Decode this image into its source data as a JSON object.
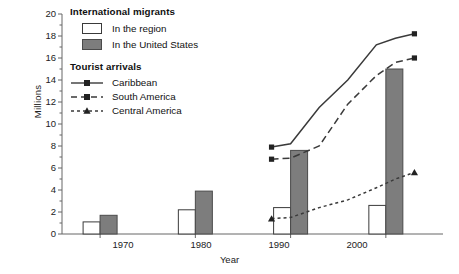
{
  "chart_data": {
    "type": "bar",
    "title": "",
    "xlabel": "Year",
    "ylabel": "Millions",
    "xlim": [
      1966,
      2006
    ],
    "ylim": [
      0,
      20
    ],
    "ytick_step": 2,
    "minor_ytick_step": 1,
    "grid": false,
    "categories": [
      "1970",
      "1980",
      "1990",
      "2000"
    ],
    "xticks": [
      1970,
      1980,
      1990,
      2000
    ],
    "yticks": [
      0,
      2,
      4,
      6,
      8,
      10,
      12,
      14,
      16,
      18,
      20
    ],
    "legend_position": "upper-left-inside",
    "bar_series": [
      {
        "name": "In the region",
        "group": "International migrants",
        "fill": "#ffffff",
        "edge": "#3a3a3a",
        "categories": [
          "1970",
          "1980",
          "1990",
          "2000"
        ],
        "values": [
          1.1,
          2.2,
          2.4,
          2.6
        ]
      },
      {
        "name": "In the United States",
        "group": "International migrants",
        "fill": "#7d7d7d",
        "edge": "#4a4a4a",
        "categories": [
          "1970",
          "1980",
          "1990",
          "2000"
        ],
        "values": [
          1.7,
          3.9,
          7.6,
          15.0
        ]
      }
    ],
    "line_series": [
      {
        "name": "Caribbean",
        "group": "Tourist arrivals",
        "style": "solid",
        "marker": "square",
        "color": "#3a3a3a",
        "x": [
          1988,
          1990,
          1993,
          1996,
          1999,
          2001,
          2003
        ],
        "values": [
          7.9,
          8.2,
          11.5,
          14.0,
          17.2,
          17.8,
          18.2
        ]
      },
      {
        "name": "South America",
        "group": "Tourist arrivals",
        "style": "dashed",
        "marker": "square",
        "color": "#3a3a3a",
        "x": [
          1988,
          1990,
          1993,
          1996,
          1999,
          2001,
          2003
        ],
        "values": [
          6.8,
          6.9,
          8.0,
          11.8,
          14.4,
          15.6,
          16.0
        ]
      },
      {
        "name": "Central America",
        "group": "Tourist arrivals",
        "style": "dotted-dashed",
        "marker": "triangle",
        "color": "#3a3a3a",
        "x": [
          1988,
          1990,
          1993,
          1996,
          1999,
          2001,
          2003
        ],
        "values": [
          1.4,
          1.5,
          2.4,
          3.1,
          4.2,
          5.0,
          5.6
        ]
      }
    ]
  },
  "axes": {
    "ylabel": "Millions",
    "xlabel": "Year",
    "ytick_labels": [
      "20",
      "18",
      "16",
      "14",
      "12",
      "10",
      "8",
      "6",
      "4",
      "2",
      "0"
    ],
    "xtick_labels": [
      "1970",
      "1980",
      "1990",
      "2000"
    ]
  },
  "legend": {
    "group1_title": "International migrants",
    "group1_items": [
      {
        "label": "In the region",
        "swatch": "open-square"
      },
      {
        "label": "In the United States",
        "swatch": "filled-square"
      }
    ],
    "group2_title": "Tourist arrivals",
    "group2_items": [
      {
        "label": "Caribbean",
        "swatch": "solid-line-square-marker"
      },
      {
        "label": "South America",
        "swatch": "dashed-line-square-marker"
      },
      {
        "label": "Central America",
        "swatch": "dotted-line-triangle-marker"
      }
    ]
  },
  "colors": {
    "bar_region_fill": "#ffffff",
    "bar_us_fill": "#7d7d7d",
    "axis": "#555555",
    "line": "#3a3a3a",
    "text": "#1a1a1a",
    "background": "#ffffff"
  }
}
